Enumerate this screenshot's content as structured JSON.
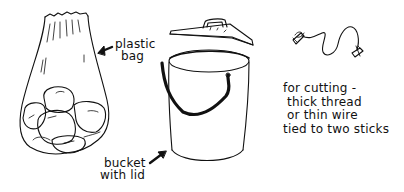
{
  "illustration": {
    "items": [
      {
        "id": "plastic-bag",
        "label_lines": [
          "plastic",
          "bag"
        ]
      },
      {
        "id": "bucket",
        "label_lines": [
          "bucket",
          "with lid"
        ]
      },
      {
        "id": "cutting-wire",
        "label_lines": [
          "for cutting -",
          "thick thread",
          "or thin wire",
          "tied to two sticks"
        ]
      }
    ]
  },
  "colors": {
    "ink": "#111111",
    "background": "#ffffff"
  }
}
